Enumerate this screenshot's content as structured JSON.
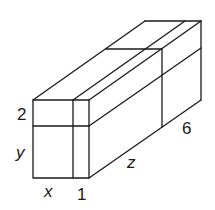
{
  "diagram": {
    "type": "rectangular prism decomposition",
    "labels": {
      "front_top_height": "2",
      "front_main_height": "y",
      "front_main_width": "x",
      "front_strip_width": "1",
      "depth_main": "z",
      "depth_extra": "6"
    },
    "colors": {
      "line": "#1a1a1a",
      "background": "#ffffff"
    }
  }
}
